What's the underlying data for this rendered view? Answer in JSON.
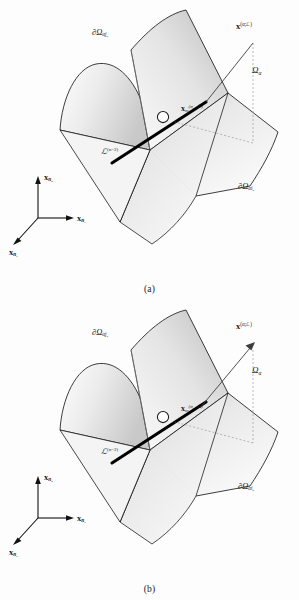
{
  "figure": {
    "type": "scientific-diagram",
    "background_color": "#fdfdfd",
    "ink_color": "#1b1b1b",
    "surface_fill_light": "#f2f2f2",
    "surface_fill_dark": "#b9b9b9",
    "edge_color": "#111111",
    "node_fill": "#ffffff"
  },
  "panels": [
    {
      "id": "a",
      "caption": "(a)",
      "vector_has_arrowhead": false,
      "labels": {
        "boundary_upper": "∂Ω",
        "boundary_upper_sub": "αj",
        "boundary_upper_sub2": "α",
        "boundary_lower": "∂Ω",
        "boundary_lower_sub": "αi",
        "boundary_lower_sub2": "α",
        "vector": "x",
        "vector_sup": "(α;ℒ)",
        "domain": "Ω",
        "domain_sub": "α",
        "node_point": "x",
        "node_point_sub": "m",
        "node_point_sup": "(σ",
        "node_point_sup_sub": "n−2",
        "node_point_sup_tail": "ℒ)",
        "edge": "ℒ",
        "edge_sup": "(n−2)"
      },
      "axes": {
        "up": "x",
        "up_sub": "n",
        "up_sub2": "2",
        "right": "x",
        "right_sub": "n",
        "right_sub2": "1",
        "down_left": "x",
        "down_left_sub": "n",
        "down_left_sub2": "3"
      }
    },
    {
      "id": "b",
      "caption": "(b)",
      "vector_has_arrowhead": true,
      "labels": {
        "boundary_upper": "∂Ω",
        "boundary_upper_sub": "αj",
        "boundary_upper_sub2": "α",
        "boundary_lower": "∂Ω",
        "boundary_lower_sub": "αi",
        "boundary_lower_sub2": "α",
        "vector": "x",
        "vector_sup": "(α;ℒ)",
        "domain": "Ω",
        "domain_sub": "α",
        "node_point": "x",
        "node_point_sub": "m",
        "node_point_sup": "(σ",
        "node_point_sup_sub": "n−2",
        "node_point_sup_tail": "ℒ)",
        "edge": "ℒ",
        "edge_sup": "(n−2)"
      },
      "axes": {
        "up": "x",
        "up_sub": "n",
        "up_sub2": "2",
        "right": "x",
        "right_sub": "n",
        "right_sub2": "1",
        "down_left": "x",
        "down_left_sub": "n",
        "down_left_sub2": "3"
      }
    }
  ]
}
